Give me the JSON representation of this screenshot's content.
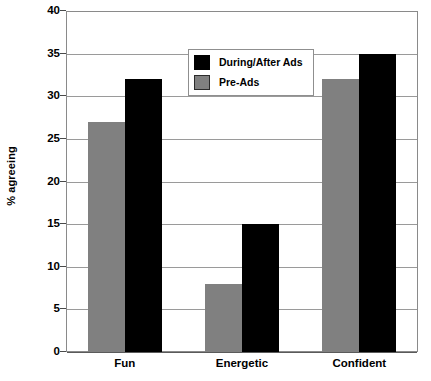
{
  "chart_data": {
    "type": "bar",
    "title": "",
    "xlabel": "",
    "ylabel": "% agreeing",
    "ylim": [
      0,
      40
    ],
    "yticks": [
      0,
      5,
      10,
      15,
      20,
      25,
      30,
      35,
      40
    ],
    "ytick_labels": [
      "0",
      "5",
      "10",
      "15",
      "20",
      "25",
      "30",
      "35",
      "40"
    ],
    "grid": true,
    "legend_position": "upper-center-left-inside",
    "categories": [
      "Fun",
      "Energetic",
      "Confident"
    ],
    "series": [
      {
        "name": "During/After Ads",
        "color": "#000000",
        "values": [
          32,
          15,
          35
        ]
      },
      {
        "name": "Pre-Ads",
        "color": "#808080",
        "values": [
          27,
          8,
          32
        ]
      }
    ]
  },
  "legend": {
    "entries": [
      {
        "label": "During/After Ads",
        "swatch": "black"
      },
      {
        "label": "Pre-Ads",
        "swatch": "gray"
      }
    ]
  },
  "colors": {
    "series_during_after_ads": "#000000",
    "series_pre_ads": "#808080",
    "background": "#FFFFFF",
    "gridline": "#9A9A9A",
    "frame": "#8A8A8A",
    "text": "#000000"
  }
}
